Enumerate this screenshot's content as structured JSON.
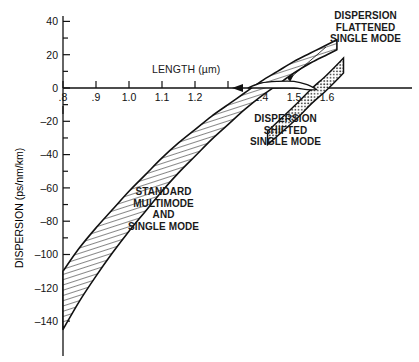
{
  "figure": {
    "background": "#ffffff",
    "ink": "#111111"
  },
  "chart_data": {
    "type": "line",
    "title": "",
    "xlabel": "LENGTH (µm)",
    "ylabel": "DISPERSION (ps/nm/km)",
    "xlim": [
      0.8,
      1.65
    ],
    "ylim": [
      -148,
      45
    ],
    "xticks": [
      0.8,
      0.9,
      1.0,
      1.1,
      1.2,
      1.3,
      1.4,
      1.5,
      1.6
    ],
    "xticklabels": [
      ".8",
      ".9",
      "1.0",
      "1.1",
      "1.2",
      "",
      "1.4",
      "1.5",
      "1.6"
    ],
    "yticks": [
      40,
      30,
      20,
      10,
      0,
      -10,
      -20,
      -30,
      -40,
      -50,
      -60,
      -70,
      -80,
      -90,
      -100,
      -110,
      -120,
      -130,
      -140
    ],
    "yticklabels": [
      "40",
      "",
      "20",
      "",
      "0",
      "",
      "–20",
      "",
      "–40",
      "",
      "–60",
      "",
      "–80",
      "",
      "–100",
      "",
      "–120",
      "",
      "–140"
    ],
    "grid": false,
    "legend_position": "inline-annotations",
    "series": [
      {
        "name": "STANDARD MULTIMODE AND SINGLE MODE",
        "style": "hatched-band-diagonal",
        "upper": [
          [
            0.8,
            -110
          ],
          [
            0.85,
            -96
          ],
          [
            0.9,
            -84
          ],
          [
            0.95,
            -73
          ],
          [
            1.0,
            -62
          ],
          [
            1.05,
            -52
          ],
          [
            1.1,
            -42
          ],
          [
            1.15,
            -33
          ],
          [
            1.2,
            -25
          ],
          [
            1.25,
            -17
          ],
          [
            1.3,
            -10
          ],
          [
            1.35,
            -3
          ],
          [
            1.4,
            4
          ],
          [
            1.45,
            10
          ],
          [
            1.5,
            16
          ],
          [
            1.55,
            21
          ],
          [
            1.6,
            26
          ],
          [
            1.63,
            29
          ]
        ],
        "lower": [
          [
            0.8,
            -145
          ],
          [
            0.85,
            -128
          ],
          [
            0.9,
            -113
          ],
          [
            0.95,
            -99
          ],
          [
            1.0,
            -86
          ],
          [
            1.05,
            -74
          ],
          [
            1.1,
            -62
          ],
          [
            1.15,
            -51
          ],
          [
            1.2,
            -41
          ],
          [
            1.25,
            -31
          ],
          [
            1.3,
            -22
          ],
          [
            1.35,
            -13
          ],
          [
            1.4,
            -5
          ],
          [
            1.45,
            2
          ],
          [
            1.5,
            9
          ],
          [
            1.55,
            15
          ],
          [
            1.6,
            20
          ],
          [
            1.63,
            23
          ]
        ],
        "zero_crossing": 1.36
      },
      {
        "name": "DISPERSION FLATTENED SINGLE MODE",
        "style": "thin-lens-band",
        "upper": [
          [
            1.36,
            0
          ],
          [
            1.4,
            3
          ],
          [
            1.45,
            4
          ],
          [
            1.5,
            4
          ],
          [
            1.54,
            2
          ],
          [
            1.57,
            -1
          ]
        ],
        "lower": [
          [
            1.36,
            0
          ],
          [
            1.4,
            0
          ],
          [
            1.45,
            0
          ],
          [
            1.5,
            0
          ],
          [
            1.54,
            -1
          ],
          [
            1.57,
            -1
          ]
        ]
      },
      {
        "name": "DISPERSION SHIFTED SINGLE MODE",
        "style": "dotted-band-diagonal",
        "upper": [
          [
            1.42,
            -26
          ],
          [
            1.5,
            -11
          ],
          [
            1.55,
            -1
          ],
          [
            1.6,
            8
          ],
          [
            1.65,
            18
          ]
        ],
        "lower": [
          [
            1.42,
            -34
          ],
          [
            1.5,
            -20
          ],
          [
            1.55,
            -10
          ],
          [
            1.6,
            -1
          ],
          [
            1.65,
            9
          ]
        ],
        "zero_crossing": 1.565
      }
    ]
  },
  "annotations": {
    "flattened": {
      "lines": [
        "DISPERSION",
        "FLATTENED",
        "SINGLE MODE"
      ],
      "leader": true
    },
    "shifted": {
      "lines": [
        "DISPERSION",
        "SHIFTED",
        "SINGLE MODE"
      ]
    },
    "standard": {
      "lines": [
        "STANDARD",
        "MULTIMODE",
        "AND",
        "SINGLE MODE"
      ]
    }
  }
}
